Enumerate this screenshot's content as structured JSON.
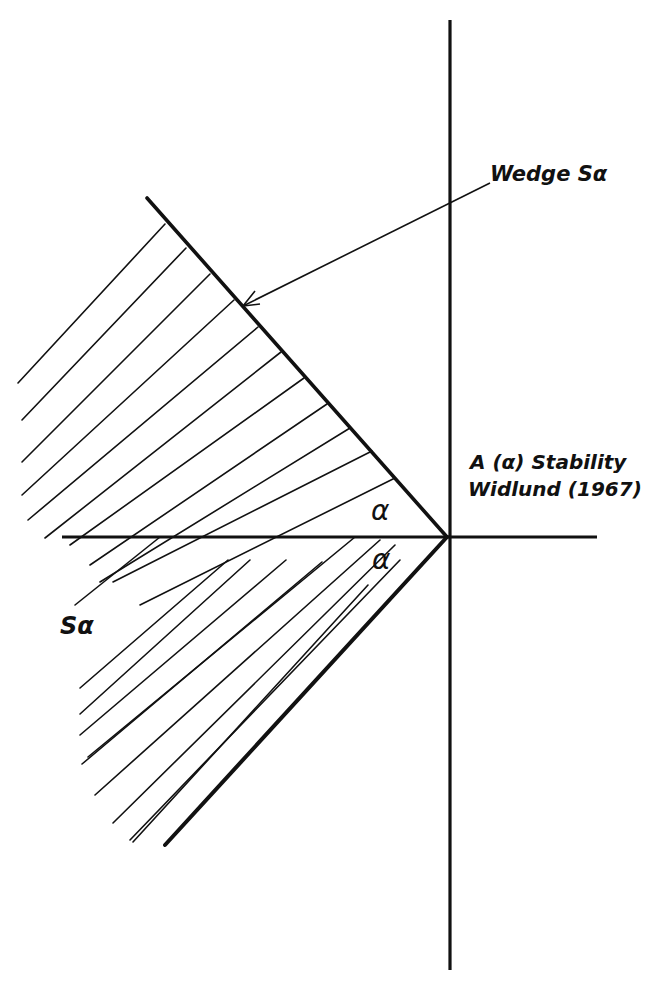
{
  "labels": {
    "wedge": "Wedge Sα",
    "title_line1": "A (α) Stability",
    "title_line2": "Widlund (1967)",
    "alpha_upper": "α",
    "alpha_lower": "α",
    "region": "Sα"
  },
  "colors": {
    "ink": "#111111",
    "background": "#ffffff"
  },
  "geometry": {
    "origin": [
      447,
      537
    ],
    "vertical_axis": {
      "x": 450,
      "y_top": 20,
      "y_bottom": 970
    },
    "horizontal_axis": {
      "y": 537,
      "x_left": 62,
      "x_right": 597
    },
    "upper_ray_end": [
      147,
      198
    ],
    "lower_ray_end": [
      165,
      845
    ],
    "arrow_from": [
      490,
      183
    ],
    "arrow_to": [
      243,
      306
    ]
  }
}
